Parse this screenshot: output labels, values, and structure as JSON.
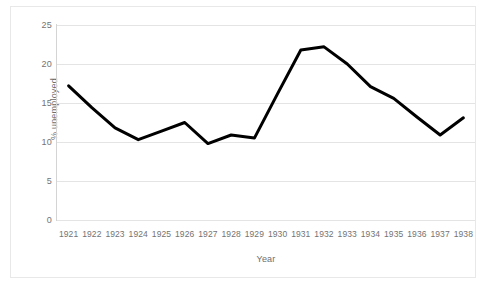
{
  "chart_data": {
    "type": "line",
    "title": "",
    "xlabel": "Year",
    "ylabel": "% unemployed",
    "x": [
      1921,
      1922,
      1923,
      1924,
      1925,
      1926,
      1927,
      1928,
      1929,
      1930,
      1931,
      1932,
      1933,
      1934,
      1935,
      1936,
      1937,
      1938
    ],
    "categories": [
      "1921",
      "1922",
      "1923",
      "1924",
      "1925",
      "1926",
      "1927",
      "1928",
      "1929",
      "1930",
      "1931",
      "1932",
      "1933",
      "1934",
      "1935",
      "1936",
      "1937",
      "1938"
    ],
    "values": [
      17.2,
      14.4,
      11.8,
      10.3,
      11.4,
      12.5,
      9.8,
      10.9,
      10.5,
      16.2,
      21.8,
      22.2,
      20.0,
      17.1,
      15.6,
      13.2,
      10.9,
      13.1
    ],
    "series": [
      {
        "name": "% unemployed",
        "color": "#000000",
        "values": [
          17.2,
          14.4,
          11.8,
          10.3,
          11.4,
          12.5,
          9.8,
          10.9,
          10.5,
          16.2,
          21.8,
          22.2,
          20.0,
          17.1,
          15.6,
          13.2,
          10.9,
          13.1
        ]
      }
    ],
    "ylim": [
      0,
      25
    ],
    "yticks": [
      0,
      5,
      10,
      15,
      20,
      25
    ],
    "ytick_labels": [
      "0",
      "5",
      "10",
      "15",
      "20",
      "25"
    ],
    "grid": {
      "horizontal": true,
      "vertical": false,
      "color": "#e4e4e4"
    },
    "legend": {
      "visible": false,
      "position": "none"
    },
    "line_width": 3,
    "markers": false,
    "background": "#ffffff",
    "frame_color": "#e8e8e8",
    "axis_color": "#d4d4d4",
    "tick_label_color": "#737373"
  }
}
